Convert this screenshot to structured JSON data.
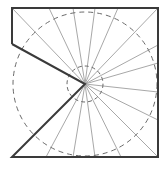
{
  "diagram": {
    "center": [
      85,
      84
    ],
    "outline": [
      [
        12,
        44
      ],
      [
        12,
        8
      ],
      [
        158,
        8
      ],
      [
        158,
        157
      ],
      [
        12,
        157
      ],
      [
        85,
        84
      ],
      [
        12,
        44
      ]
    ],
    "outer_circle_radius": 72,
    "inner_circle_radius": 18,
    "ray_endpoints": [
      [
        12,
        8
      ],
      [
        49,
        8
      ],
      [
        73,
        8
      ],
      [
        95,
        8
      ],
      [
        118,
        8
      ],
      [
        158,
        8
      ],
      [
        158,
        45
      ],
      [
        158,
        63
      ],
      [
        158,
        92
      ],
      [
        158,
        120
      ],
      [
        158,
        157
      ],
      [
        121,
        157
      ],
      [
        95,
        157
      ],
      [
        73,
        157
      ],
      [
        46,
        157
      ]
    ],
    "colors": {
      "outline": "#3a3a3a",
      "ray": "#a8a8a8",
      "dashed_circle": "#6a6a6a",
      "background": "#ffffff"
    }
  }
}
